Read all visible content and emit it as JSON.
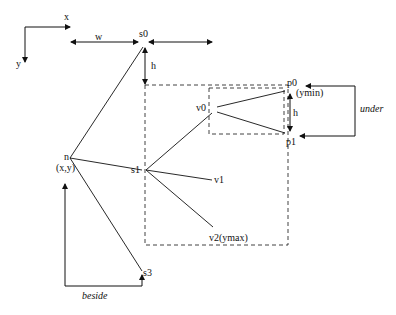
{
  "axes": {
    "x_label": "x",
    "y_label": "y"
  },
  "dimensions": {
    "width_label": "w",
    "height_label": "h",
    "height_label_inner": "h"
  },
  "nodes": {
    "s0": "s0",
    "s1": "s1",
    "s3": "s3",
    "n": "n",
    "n_coords": "(x,y)",
    "v0": "v0",
    "v1": "v1",
    "v2": "v2(ymax)",
    "p0": "p0",
    "p0_note": "(ymin)",
    "p1": "p1"
  },
  "relations": {
    "under": "under",
    "beside": "beside"
  },
  "colors": {
    "stroke": "#111111",
    "background": "#ffffff"
  }
}
